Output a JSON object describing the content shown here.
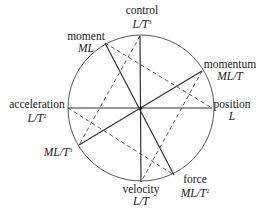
{
  "diagram": {
    "nodes": [
      {
        "id": "control",
        "name": "control",
        "dim": "L/T",
        "exp": "3"
      },
      {
        "id": "moment",
        "name": "moment",
        "dim": "ML",
        "exp": ""
      },
      {
        "id": "momentum",
        "name": "momentum",
        "dim": "ML/T",
        "exp": ""
      },
      {
        "id": "position",
        "name": "position",
        "dim": "L",
        "exp": ""
      },
      {
        "id": "acceleration",
        "name": "acceleration",
        "dim": "L/T",
        "exp": "2"
      },
      {
        "id": "ml-t3",
        "name": "",
        "dim": "ML/T",
        "exp": "3"
      },
      {
        "id": "velocity",
        "name": "velocity",
        "dim": "L/T",
        "exp": ""
      },
      {
        "id": "force",
        "name": "force",
        "dim": "ML/T",
        "exp": "2"
      }
    ],
    "solid_edges": [
      [
        "control",
        "velocity"
      ],
      [
        "acceleration",
        "position"
      ],
      [
        "momentum",
        "ml-t3"
      ],
      [
        "moment",
        "force"
      ]
    ],
    "dashed_edges": [
      [
        "moment",
        "position"
      ],
      [
        "acceleration",
        "force"
      ],
      [
        "control",
        "ml-t3"
      ],
      [
        "momentum",
        "velocity"
      ]
    ]
  }
}
